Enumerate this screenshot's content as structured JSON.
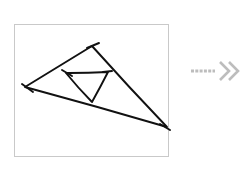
{
  "canvas": {
    "width": 251,
    "height": 170,
    "background_color": "#ffffff"
  },
  "frame": {
    "label": "drawing frame",
    "x": 14.5,
    "y": 24.5,
    "width": 154,
    "height": 132,
    "stroke_color": "#c9c9c9",
    "stroke_width": 1,
    "fill_color": "#ffffff"
  },
  "sketch": {
    "title": "hand-drawn nested triangles",
    "stroke_color": "#111111",
    "stroke_width": 1.9,
    "outer_triangle": {
      "label": "outer triangle",
      "vertices": [
        {
          "name": "apex-top",
          "x": 92,
          "y": 46
        },
        {
          "name": "vertex-left",
          "x": 25,
          "y": 87
        },
        {
          "name": "vertex-bottom-right",
          "x": 167,
          "y": 127
        }
      ],
      "edges": [
        {
          "name": "edge-top-left",
          "from": "apex-top",
          "to": "vertex-left"
        },
        {
          "name": "edge-left-bottom",
          "from": "vertex-left",
          "to": "vertex-bottom-right"
        },
        {
          "name": "edge-right",
          "from": "vertex-bottom-right",
          "to": "apex-top"
        }
      ],
      "overshoots": [
        {
          "name": "overshoot-apex",
          "x1": 87,
          "y1": 48,
          "x2": 99,
          "y2": 43
        },
        {
          "name": "overshoot-left",
          "x1": 22,
          "y1": 84,
          "x2": 33,
          "y2": 92
        },
        {
          "name": "overshoot-bottom-right",
          "x1": 160,
          "y1": 124,
          "x2": 170,
          "y2": 130
        }
      ]
    },
    "inner_triangle": {
      "label": "inner triangle",
      "vertices": [
        {
          "name": "vertex-left",
          "x": 66,
          "y": 73
        },
        {
          "name": "vertex-right",
          "x": 108,
          "y": 72
        },
        {
          "name": "vertex-bottom",
          "x": 92,
          "y": 102
        }
      ],
      "edges": [
        {
          "name": "edge-top",
          "from": "vertex-left",
          "to": "vertex-right"
        },
        {
          "name": "edge-right",
          "from": "vertex-right",
          "to": "vertex-bottom"
        },
        {
          "name": "edge-left",
          "from": "vertex-bottom",
          "to": "vertex-left"
        }
      ],
      "overshoots": [
        {
          "name": "overshoot-left",
          "x1": 62,
          "y1": 70,
          "x2": 72,
          "y2": 76
        },
        {
          "name": "overshoot-right",
          "x1": 103,
          "y1": 72,
          "x2": 112,
          "y2": 71
        }
      ]
    }
  },
  "arrow": {
    "label": "transformation arrow",
    "direction": "right",
    "color": "#bdbdbd",
    "dash_count": 6,
    "dash_start_x": 191,
    "dash_end_x": 215,
    "dash_y": 71,
    "dash_length": 3,
    "dash_gap": 1.3,
    "dash_thickness": 3,
    "chevrons": [
      {
        "name": "chevron-1",
        "tip_x": 229,
        "tip_y": 71,
        "half_height": 9
      },
      {
        "name": "chevron-2",
        "tip_x": 238,
        "tip_y": 71,
        "half_height": 9
      }
    ],
    "chevron_stroke_width": 2.6
  }
}
